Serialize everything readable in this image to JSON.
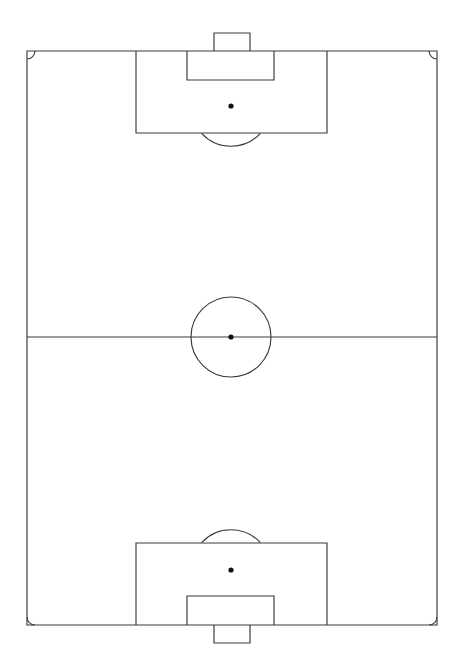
{
  "figure": {
    "title": "Association football pitch — plan view",
    "caption": "",
    "orientation": "vertical",
    "background_color": "#ffffff",
    "line_color": "#3a3a3a",
    "spot_color": "#111111",
    "line_width_px": 1.15
  },
  "canvas": {
    "width": 462,
    "height": 671
  },
  "chart_data": {
    "type": "diagram",
    "title": "Association football pitch — plan view",
    "xlabel": "",
    "ylabel": "",
    "xlim": [
      0,
      462
    ],
    "ylim": [
      0,
      671
    ],
    "grid": false,
    "legend": "none",
    "units": "pixels",
    "elements": [
      {
        "name": "field-of-play",
        "shape": "rect",
        "x": 27,
        "y": 51,
        "width": 410,
        "height": 574
      },
      {
        "name": "halfway-line",
        "shape": "line",
        "x1": 27,
        "y1": 337,
        "x2": 437,
        "y2": 337
      },
      {
        "name": "centre-circle",
        "shape": "circle",
        "cx": 231,
        "cy": 337,
        "r": 40
      },
      {
        "name": "centre-spot",
        "shape": "dot",
        "cx": 231,
        "cy": 337,
        "r": 2.6
      },
      {
        "name": "top-penalty-area",
        "shape": "rect",
        "x": 136,
        "y": 51,
        "width": 191,
        "height": 82
      },
      {
        "name": "top-goal-area",
        "shape": "rect",
        "x": 187,
        "y": 51,
        "width": 87,
        "height": 29
      },
      {
        "name": "top-goal",
        "shape": "rect",
        "x": 214,
        "y": 33,
        "width": 36,
        "height": 18
      },
      {
        "name": "top-penalty-spot",
        "shape": "dot",
        "cx": 231,
        "cy": 106,
        "r": 2.6
      },
      {
        "name": "top-penalty-arc",
        "shape": "arc",
        "cx": 231,
        "cy": 106,
        "r": 40,
        "start_deg": 42.7,
        "end_deg": 137.3
      },
      {
        "name": "bottom-penalty-area",
        "shape": "rect",
        "x": 136,
        "y": 543,
        "width": 191,
        "height": 82
      },
      {
        "name": "bottom-goal-area",
        "shape": "rect",
        "x": 187,
        "y": 596,
        "width": 87,
        "height": 29
      },
      {
        "name": "bottom-goal",
        "shape": "rect",
        "x": 214,
        "y": 625,
        "width": 36,
        "height": 18
      },
      {
        "name": "bottom-penalty-spot",
        "shape": "dot",
        "cx": 231,
        "cy": 570,
        "r": 2.6
      },
      {
        "name": "bottom-penalty-arc",
        "shape": "arc",
        "cx": 231,
        "cy": 570,
        "r": 40,
        "start_deg": 222.7,
        "end_deg": 317.3
      },
      {
        "name": "corner-arc-top-left",
        "shape": "corner-arc",
        "cx": 27,
        "cy": 51,
        "r": 8
      },
      {
        "name": "corner-arc-top-right",
        "shape": "corner-arc",
        "cx": 437,
        "cy": 51,
        "r": 8
      },
      {
        "name": "corner-arc-bottom-left",
        "shape": "corner-arc",
        "cx": 27,
        "cy": 625,
        "r": 8
      },
      {
        "name": "corner-arc-bottom-right",
        "shape": "corner-arc",
        "cx": 437,
        "cy": 625,
        "r": 8
      }
    ],
    "paths": {
      "field_of_play": "M 27 51 L 437 51 L 437 625 L 27 625 Z",
      "halfway_line": "M 27 337 L 437 337",
      "top_penalty_area": "M 136 51 L 136 133 L 327 133 L 327 51",
      "top_goal_area": "M 187 51 L 187 80 L 274 80 L 274 51",
      "top_goal": "M 214 51 L 214 33 L 250 33 L 250 51",
      "top_penalty_arc": "M 201.6 133.4 A 40 40 0 0 0 260.4 133.4",
      "bottom_penalty_area": "M 136 625 L 136 543 L 327 543 L 327 625",
      "bottom_goal_area": "M 187 625 L 187 596 L 274 596 L 274 625",
      "bottom_goal": "M 214 625 L 214 643 L 250 643 L 250 625",
      "bottom_penalty_arc": "M 201.6 542.6 A 40 40 0 0 1 260.4 542.6",
      "corner_tl": "M 35 51 A 8 8 0 0 1 27 59",
      "corner_tr": "M 429 51 A 8 8 0 0 0 437 59",
      "corner_bl": "M 27 617 A 8 8 0 0 0 35 625",
      "corner_br": "M 437 617 A 8 8 0 0 1 429 625"
    }
  }
}
